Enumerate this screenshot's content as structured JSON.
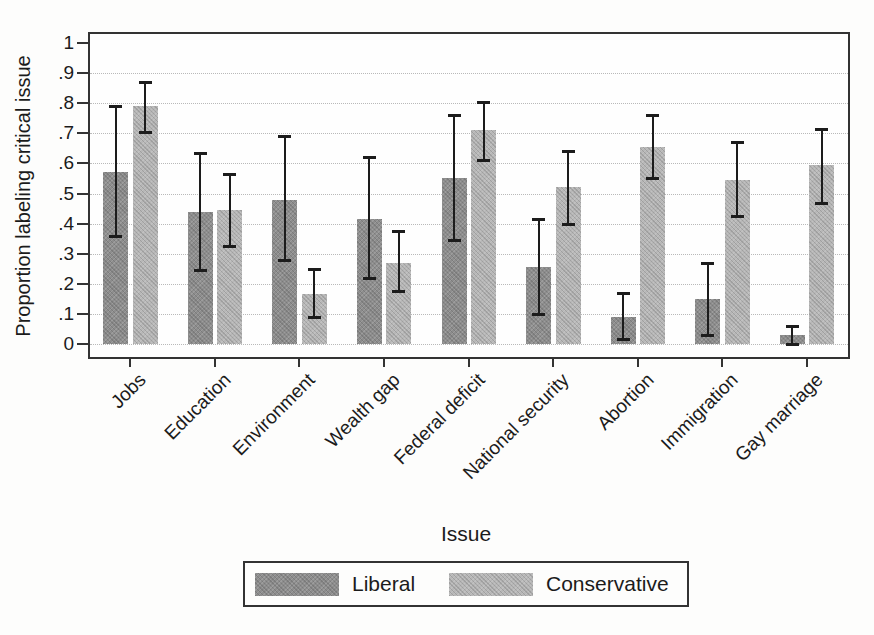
{
  "chart_data": {
    "type": "bar",
    "title": "",
    "xlabel": "Issue",
    "ylabel": "Proportion labeling critical issue",
    "ylim": [
      0,
      1
    ],
    "grid": "horizontal-dotted",
    "grid_values": [
      0,
      0.1,
      0.2,
      0.3,
      0.4,
      0.5,
      0.6,
      0.7,
      0.8,
      0.9
    ],
    "yticks": [
      {
        "value": 0,
        "label": "0"
      },
      {
        "value": 0.1,
        "label": ".1"
      },
      {
        "value": 0.2,
        "label": ".2"
      },
      {
        "value": 0.3,
        "label": ".3"
      },
      {
        "value": 0.4,
        "label": ".4"
      },
      {
        "value": 0.5,
        "label": ".5"
      },
      {
        "value": 0.6,
        "label": ".6"
      },
      {
        "value": 0.7,
        "label": ".7"
      },
      {
        "value": 0.8,
        "label": ".8"
      },
      {
        "value": 0.9,
        "label": ".9"
      },
      {
        "value": 1,
        "label": "1"
      }
    ],
    "categories": [
      "Jobs",
      "Education",
      "Environment",
      "Wealth gap",
      "Federal deficit",
      "National security",
      "Abortion",
      "Immigration",
      "Gay marriage"
    ],
    "legend_position": "bottom",
    "error_bars": true,
    "series": [
      {
        "name": "Liberal",
        "color": "#8d8d8d",
        "values": [
          0.57,
          0.44,
          0.48,
          0.415,
          0.55,
          0.255,
          0.09,
          0.15,
          0.03
        ],
        "ci_low": [
          0.36,
          0.245,
          0.28,
          0.22,
          0.345,
          0.1,
          0.015,
          0.03,
          0.0
        ],
        "ci_high": [
          0.79,
          0.635,
          0.69,
          0.62,
          0.76,
          0.415,
          0.17,
          0.27,
          0.06
        ]
      },
      {
        "name": "Conservative",
        "color": "#b7b7b7",
        "values": [
          0.79,
          0.445,
          0.165,
          0.27,
          0.71,
          0.52,
          0.655,
          0.545,
          0.595
        ],
        "ci_low": [
          0.705,
          0.325,
          0.09,
          0.175,
          0.61,
          0.4,
          0.55,
          0.425,
          0.47
        ],
        "ci_high": [
          0.87,
          0.565,
          0.25,
          0.375,
          0.805,
          0.64,
          0.76,
          0.67,
          0.715
        ]
      }
    ]
  }
}
